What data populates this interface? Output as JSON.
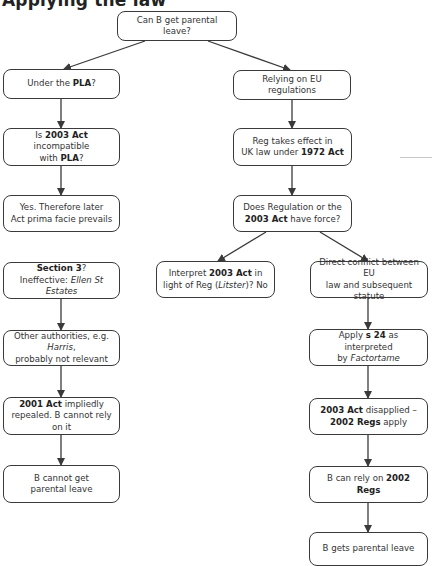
{
  "heading": {
    "text": "Applying the law"
  },
  "colors": {
    "border": "#3a3a3a",
    "text": "#333333",
    "background": "#ffffff",
    "arrow": "#3a3a3a"
  },
  "nodes": [
    {
      "id": "root",
      "parts": [
        {
          "t": "Can B get parental leave?"
        }
      ]
    },
    {
      "id": "pla",
      "parts": [
        {
          "t": "Under the "
        },
        {
          "t": "PLA",
          "b": true
        },
        {
          "t": "?"
        }
      ]
    },
    {
      "id": "eu",
      "parts": [
        {
          "t": "Relying on EU regulations"
        }
      ]
    },
    {
      "id": "incompat",
      "parts": [
        {
          "t": "Is "
        },
        {
          "t": "2003 Act",
          "b": true
        },
        {
          "t": " incompatible"
        },
        {
          "br": true
        },
        {
          "t": "with "
        },
        {
          "t": "PLA",
          "b": true
        },
        {
          "t": "?"
        }
      ]
    },
    {
      "id": "reg-effect",
      "parts": [
        {
          "t": "Reg takes effect in"
        },
        {
          "br": true
        },
        {
          "t": "UK law under "
        },
        {
          "t": "1972 Act",
          "b": true
        }
      ]
    },
    {
      "id": "prevails",
      "parts": [
        {
          "t": "Yes. Therefore later"
        },
        {
          "br": true
        },
        {
          "t": "Act prima facie prevails"
        }
      ]
    },
    {
      "id": "force",
      "parts": [
        {
          "t": "Does Regulation or the"
        },
        {
          "br": true
        },
        {
          "t": "2003 Act",
          "b": true
        },
        {
          "t": " have force?"
        }
      ]
    },
    {
      "id": "section3",
      "parts": [
        {
          "t": "Section 3",
          "b": true
        },
        {
          "t": "?"
        },
        {
          "br": true
        },
        {
          "t": "Ineffective: "
        },
        {
          "t": "Ellen St Estates",
          "i": true
        }
      ]
    },
    {
      "id": "interpret",
      "parts": [
        {
          "t": "Interpret "
        },
        {
          "t": "2003 Act",
          "b": true
        },
        {
          "t": " in"
        },
        {
          "br": true
        },
        {
          "t": "light of Reg ("
        },
        {
          "t": "Litster",
          "i": true
        },
        {
          "t": ")? No"
        }
      ]
    },
    {
      "id": "conflict",
      "parts": [
        {
          "t": "Direct conflict between EU"
        },
        {
          "br": true
        },
        {
          "t": "law and subsequent statute"
        }
      ]
    },
    {
      "id": "other",
      "parts": [
        {
          "t": "Other authorities, e.g. "
        },
        {
          "t": "Harris",
          "i": true
        },
        {
          "t": ","
        },
        {
          "br": true
        },
        {
          "t": "probably not relevant"
        }
      ]
    },
    {
      "id": "s24",
      "parts": [
        {
          "t": "Apply "
        },
        {
          "t": "s 24",
          "b": true
        },
        {
          "t": " as interpreted"
        },
        {
          "br": true
        },
        {
          "t": "by "
        },
        {
          "t": "Factortame",
          "i": true
        }
      ]
    },
    {
      "id": "repealed",
      "parts": [
        {
          "t": "2001 Act",
          "b": true
        },
        {
          "t": " impliedly"
        },
        {
          "br": true
        },
        {
          "t": "repealed. B cannot rely on it"
        }
      ]
    },
    {
      "id": "disapplied",
      "parts": [
        {
          "t": "2003 Act",
          "b": true
        },
        {
          "t": " disapplied –"
        },
        {
          "br": true
        },
        {
          "t": "2002 Regs",
          "b": true
        },
        {
          "t": " apply"
        }
      ]
    },
    {
      "id": "cannot",
      "parts": [
        {
          "t": "B cannot get"
        },
        {
          "br": true
        },
        {
          "t": "parental leave"
        }
      ]
    },
    {
      "id": "canrely",
      "parts": [
        {
          "t": "B can rely on "
        },
        {
          "t": "2002 Regs",
          "b": true
        }
      ]
    },
    {
      "id": "gets",
      "parts": [
        {
          "t": "B gets parental leave"
        }
      ]
    }
  ],
  "edges": [
    [
      "root",
      "pla"
    ],
    [
      "root",
      "eu"
    ],
    [
      "pla",
      "incompat"
    ],
    [
      "incompat",
      "prevails"
    ],
    [
      "section3",
      "other"
    ],
    [
      "other",
      "repealed"
    ],
    [
      "repealed",
      "cannot"
    ],
    [
      "eu",
      "reg-effect"
    ],
    [
      "reg-effect",
      "force"
    ],
    [
      "force",
      "interpret"
    ],
    [
      "force",
      "conflict"
    ],
    [
      "conflict",
      "s24"
    ],
    [
      "s24",
      "disapplied"
    ],
    [
      "disapplied",
      "canrely"
    ],
    [
      "canrely",
      "gets"
    ]
  ]
}
